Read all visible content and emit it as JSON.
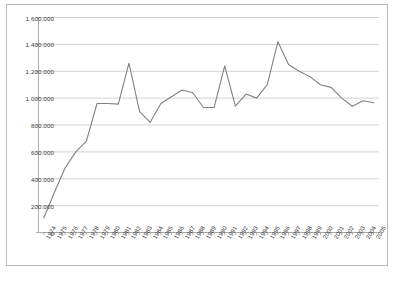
{
  "chart_data": {
    "type": "line",
    "title": "",
    "xlabel": "",
    "ylabel": "",
    "ylim": [
      0,
      1600000
    ],
    "ytick_labels": [
      "1.600.000",
      "1.400.000",
      "1.200.000",
      "1.000.000",
      "800.000",
      "600.000",
      "400.000",
      "200.000",
      "0"
    ],
    "ytick_values": [
      1600000,
      1400000,
      1200000,
      1000000,
      800000,
      600000,
      400000,
      200000,
      0
    ],
    "grid": true,
    "legend": "none",
    "line_color": "#808080",
    "grid_color": "#bfbfbf",
    "border_color": "#b9b9b9",
    "categories": [
      "1974",
      "1975",
      "1976",
      "1977",
      "1978",
      "1979",
      "1980",
      "1981",
      "1982",
      "1983",
      "1984",
      "1985",
      "1986",
      "1987",
      "1988",
      "1989",
      "1990",
      "1991",
      "1992",
      "1993",
      "1994",
      "1995",
      "1996",
      "1997",
      "1998",
      "1999",
      "2000",
      "2001",
      "2002",
      "2003",
      "2004",
      "2005"
    ],
    "values": [
      110000,
      300000,
      480000,
      600000,
      680000,
      960000,
      960000,
      955000,
      1260000,
      900000,
      820000,
      960000,
      1010000,
      1060000,
      1040000,
      930000,
      930000,
      1240000,
      940000,
      1030000,
      1000000,
      1100000,
      1420000,
      1250000,
      1200000,
      1160000,
      1100000,
      1080000,
      1000000,
      940000,
      980000,
      965000
    ]
  }
}
